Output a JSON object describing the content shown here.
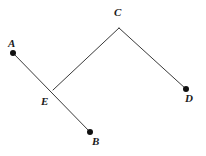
{
  "figure": {
    "background_color": "#ffffff",
    "line_color": "#3a3a3a",
    "dot_color": "#101010",
    "label_color": "#1a1a1a",
    "canvas": {
      "width": 206,
      "height": 156
    },
    "points": [
      {
        "id": "A",
        "label": "A",
        "x": 13,
        "y": 53,
        "has_dot": true,
        "label_x": 8,
        "label_y": 38
      },
      {
        "id": "B",
        "label": "B",
        "x": 90,
        "y": 132,
        "has_dot": true,
        "label_x": 92,
        "label_y": 136
      },
      {
        "id": "C",
        "label": "C",
        "x": 119,
        "y": 28,
        "has_dot": false,
        "label_x": 114,
        "label_y": 7
      },
      {
        "id": "D",
        "label": "D",
        "x": 186,
        "y": 89,
        "has_dot": true,
        "label_x": 185,
        "label_y": 93
      },
      {
        "id": "E",
        "label": "E",
        "x": 53,
        "y": 90,
        "has_dot": false,
        "label_x": 41,
        "label_y": 96
      }
    ],
    "segments": [
      {
        "id": "AB",
        "from": "A",
        "to": "B",
        "x1": 13,
        "y1": 53,
        "x2": 90,
        "y2": 132
      },
      {
        "id": "EC",
        "from": "E",
        "to": "C",
        "x1": 53,
        "y1": 90,
        "x2": 119,
        "y2": 28
      },
      {
        "id": "CD",
        "from": "C",
        "to": "D",
        "x1": 119,
        "y1": 28,
        "x2": 186,
        "y2": 89
      }
    ],
    "dot_radius": 3
  }
}
